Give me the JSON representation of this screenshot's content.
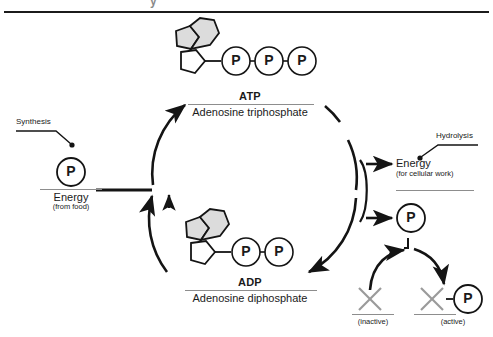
{
  "figure": {
    "cut_off_title": "y",
    "background_color": "#ffffff",
    "ink_color": "#1a1a1a",
    "ring_fill_color": "#d9d9d9"
  },
  "top_molecule": {
    "name": "ATP",
    "full_name": "Adenosine triphosphate",
    "phosphate_label": "P",
    "phosphate_count": 3,
    "rings": [
      "pentagon-base",
      "hexagon-base",
      "pentagon-sugar"
    ]
  },
  "bottom_molecule": {
    "name": "ADP",
    "full_name": "Adenosine diphosphate",
    "phosphate_label": "P",
    "phosphate_count": 2,
    "rings": [
      "pentagon-base",
      "hexagon-base",
      "pentagon-sugar"
    ]
  },
  "left_side": {
    "callout": "Synthesis",
    "phosphate_label": "P",
    "energy_line1": "Energy",
    "energy_line2": "(from food)"
  },
  "right_side": {
    "callout": "Hydrolysis",
    "energy_line1": "Energy",
    "energy_line2": "(for cellular work)",
    "phosphate_label": "P"
  },
  "activation": {
    "inactive_symbol": "X",
    "inactive_caption": "(inactive)",
    "active_symbol": "X",
    "active_link": "–",
    "active_phosphate_label": "P",
    "active_caption": "(active)"
  },
  "cycle": {
    "direction_left": "up",
    "direction_right": "down",
    "description": "ATP-ADP cycle"
  }
}
